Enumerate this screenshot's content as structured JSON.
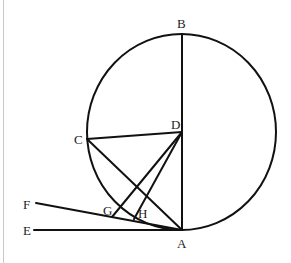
{
  "diagram": {
    "type": "geometry",
    "colors": {
      "stroke": "#111111",
      "label": "#222222",
      "background": "#ffffff",
      "border": "#c8c8c8"
    },
    "circle": {
      "cx": 181.5,
      "cy": 132,
      "rx": 94.5,
      "ry": 98
    },
    "points": {
      "A": {
        "label": "A",
        "x": 182,
        "y": 230
      },
      "B": {
        "label": "B",
        "x": 182,
        "y": 34
      },
      "C": {
        "label": "C",
        "x": 87,
        "y": 139
      },
      "D": {
        "label": "D",
        "x": 182,
        "y": 132
      },
      "E": {
        "label": "E",
        "x": 34,
        "y": 230
      },
      "F": {
        "label": "F",
        "x": 36,
        "y": 203
      },
      "G": {
        "label": "G",
        "x": 112,
        "y": 217
      },
      "H": {
        "label": "H",
        "x": 134,
        "y": 219
      }
    },
    "segments": [
      "BA",
      "CD",
      "CA",
      "DG",
      "DH",
      "FA",
      "EA"
    ],
    "labels": {
      "A": "A",
      "B": "B",
      "C": "C",
      "D": "D",
      "E": "E",
      "F": "F",
      "G": "G",
      "H": "H"
    }
  }
}
